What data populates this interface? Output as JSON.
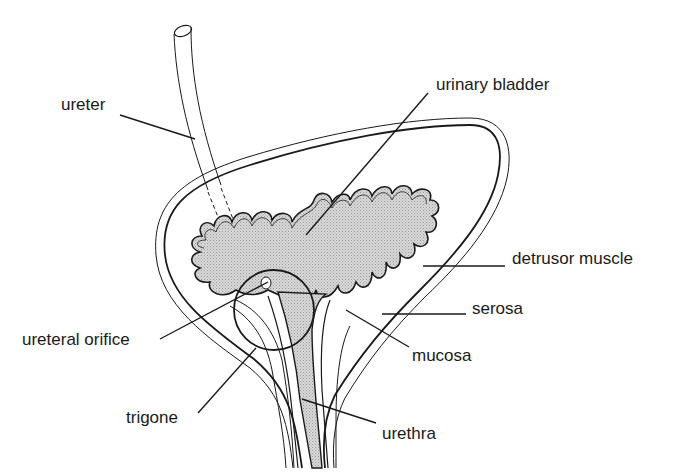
{
  "diagram": {
    "colors": {
      "line": "#1a1a1a",
      "lumen_fill": "#cfcfcf",
      "background": "#ffffff"
    },
    "labels": {
      "ureter": "ureter",
      "urinary_bladder": "urinary bladder",
      "detrusor_muscle": "detrusor muscle",
      "serosa": "serosa",
      "ureteral_orifice": "ureteral orifice",
      "mucosa": "mucosa",
      "trigone": "trigone",
      "urethra": "urethra"
    }
  }
}
